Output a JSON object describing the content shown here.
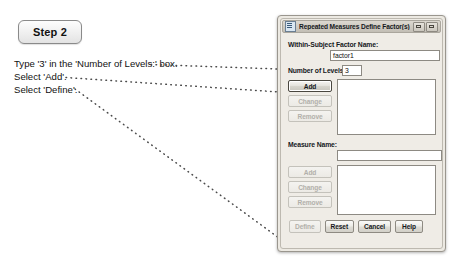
{
  "annotation": {
    "step_badge": "Step 2",
    "instructions": [
      "Type '3' in the 'Number of Levels:' box.",
      "Select 'Add'.",
      "Select 'Define'."
    ]
  },
  "dialog": {
    "title": "Repeated Measures Define Factor(s)",
    "title_icon": "repeated-measures-icon",
    "window_controls": [
      {
        "name": "minimize-restore-button",
        "glyph": "minimize"
      },
      {
        "name": "help-close-button",
        "glyph": "close"
      }
    ],
    "factor": {
      "name_label": "Within-Subject Factor Name:",
      "name_value": "factor1",
      "name_placeholder": "",
      "levels_label": "Number of Levels:",
      "levels_value": "3",
      "levels_placeholder": "",
      "buttons": [
        {
          "label": "Add",
          "state": "focused"
        },
        {
          "label": "Change",
          "state": "disabled"
        },
        {
          "label": "Remove",
          "state": "disabled"
        }
      ],
      "list_items": []
    },
    "measure": {
      "name_label": "Measure Name:",
      "name_value": "",
      "name_placeholder": "",
      "buttons": [
        {
          "label": "Add",
          "state": "disabled"
        },
        {
          "label": "Change",
          "state": "disabled"
        },
        {
          "label": "Remove",
          "state": "disabled"
        }
      ],
      "list_items": []
    },
    "footer_buttons": [
      {
        "label": "Define",
        "state": "disabled"
      },
      {
        "label": "Reset",
        "state": "normal"
      },
      {
        "label": "Cancel",
        "state": "normal"
      },
      {
        "label": "Help",
        "state": "normal"
      }
    ]
  },
  "colors": {
    "dialog_face": "#ece9e2",
    "dialog_border": "#9a968e",
    "titlebar": "#cfcbc2",
    "field_background": "#ffffff",
    "field_border": "#8d8a83",
    "text": "#15181c",
    "disabled_text": "#b2b0aa",
    "leader_line": "#4a4a4a",
    "page_background": "#ffffff"
  }
}
